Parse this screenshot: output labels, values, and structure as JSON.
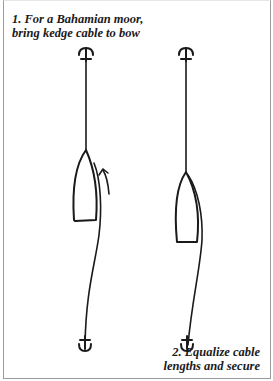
{
  "diagram": {
    "steps": [
      {
        "number": "1.",
        "caption_line1": "1. For a Bahamian moor,",
        "caption_line2": "bring kedge cable to bow"
      },
      {
        "number": "2.",
        "caption_line1": "2. Equalize cable",
        "caption_line2": "lengths and secure"
      }
    ],
    "elements": {
      "left_figure": [
        "anchor-top",
        "cable",
        "boat-hull",
        "kedge-cable",
        "movement-arrow",
        "anchor-bottom"
      ],
      "right_figure": [
        "anchor-top",
        "cable",
        "boat-hull",
        "kedge-cable",
        "anchor-bottom"
      ]
    },
    "colors": {
      "ink": "#1a1a1a",
      "frame": "#9a9a9a",
      "background": "#ffffff"
    }
  }
}
